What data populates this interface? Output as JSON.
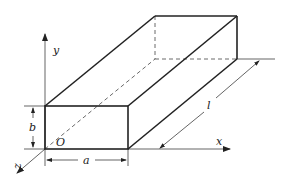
{
  "diagram": {
    "type": "3d rectangular prism with coordinate axes",
    "labels": {
      "y_axis": "y",
      "x_axis": "x",
      "z_axis": "z",
      "origin": "O",
      "width": "a",
      "height": "b",
      "length": "l"
    },
    "colors": {
      "stroke": "#222222",
      "background": "#ffffff"
    }
  }
}
